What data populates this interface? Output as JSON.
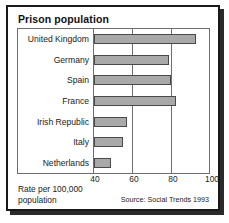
{
  "figure": {
    "title": "Prison population",
    "axis_title_line1": "Rate per 100,000",
    "axis_title_line2": "population",
    "source": "Source: Social Trends 1993",
    "colors": {
      "bar_fill": "#a9a9a9",
      "bar_outline": "#4a4a4a",
      "frame": "#6e6e6e",
      "border": "#1a1a1a",
      "text": "#1a1a1a",
      "background": "#ffffff"
    }
  },
  "chart_data": {
    "type": "bar",
    "orientation": "horizontal",
    "title": "Prison population",
    "xlabel": "Rate per 100,000 population",
    "ylabel": "",
    "xlim": [
      40,
      100
    ],
    "xticks": [
      40,
      60,
      80,
      100
    ],
    "grid": true,
    "legend": null,
    "source": "Source: Social Trends 1993",
    "categories": [
      "United Kingdom",
      "Germany",
      "Spain",
      "France",
      "Irish Republic",
      "Italy",
      "Netherlands"
    ],
    "values": [
      93,
      79,
      80,
      83,
      57,
      55,
      49
    ]
  }
}
